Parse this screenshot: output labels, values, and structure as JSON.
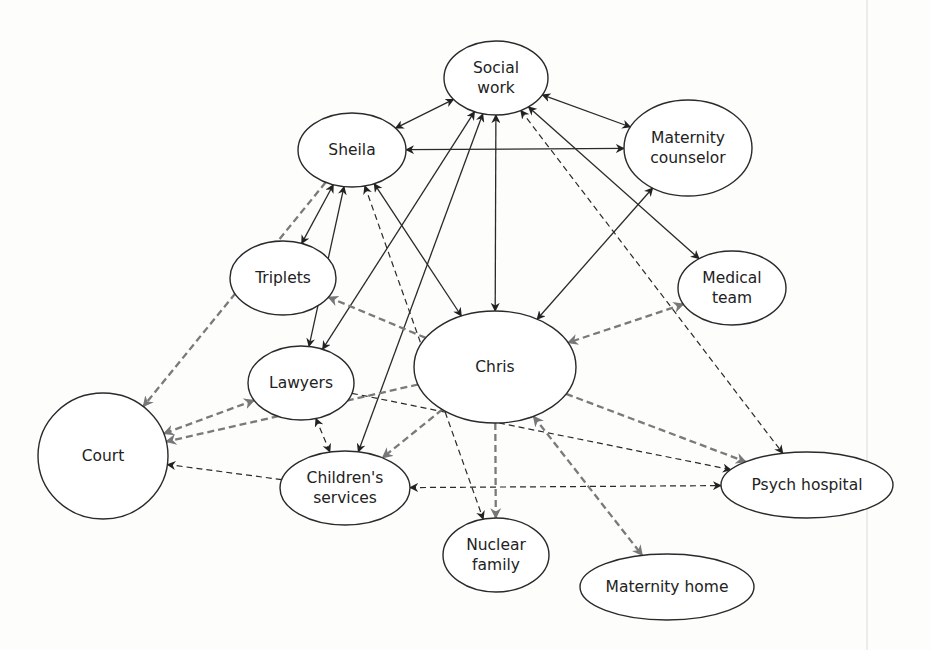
{
  "diagram": {
    "title": "",
    "colors": {
      "node_stroke": "#2a2a2a",
      "solid_edge": "#2a2a2a",
      "dashed_dark_edge": "#2a2a2a",
      "dashed_gray_edge": "#7a7a7a",
      "background": "#fdfdfc"
    },
    "nodes": [
      {
        "id": "social_work",
        "lines": [
          "Social",
          "work"
        ],
        "cx": 496,
        "cy": 78,
        "rx": 52,
        "ry": 37
      },
      {
        "id": "maternity_counselor",
        "lines": [
          "Maternity",
          "counselor"
        ],
        "cx": 688,
        "cy": 148,
        "rx": 64,
        "ry": 48
      },
      {
        "id": "sheila",
        "lines": [
          "Sheila"
        ],
        "cx": 352,
        "cy": 150,
        "rx": 54,
        "ry": 37
      },
      {
        "id": "triplets",
        "lines": [
          "Triplets"
        ],
        "cx": 283,
        "cy": 278,
        "rx": 53,
        "ry": 37
      },
      {
        "id": "medical_team",
        "lines": [
          "Medical",
          "team"
        ],
        "cx": 732,
        "cy": 288,
        "rx": 54,
        "ry": 37
      },
      {
        "id": "chris",
        "lines": [
          "Chris"
        ],
        "cx": 495,
        "cy": 367,
        "rx": 81,
        "ry": 56
      },
      {
        "id": "lawyers",
        "lines": [
          "Lawyers"
        ],
        "cx": 301,
        "cy": 383,
        "rx": 53,
        "ry": 37
      },
      {
        "id": "court",
        "lines": [
          "Court"
        ],
        "cx": 103,
        "cy": 456,
        "rx": 65,
        "ry": 63
      },
      {
        "id": "childrens_services",
        "lines": [
          "Children's",
          "services"
        ],
        "cx": 345,
        "cy": 488,
        "rx": 65,
        "ry": 37
      },
      {
        "id": "psych_hospital",
        "lines": [
          "Psych hospital"
        ],
        "cx": 807,
        "cy": 485,
        "rx": 86,
        "ry": 33
      },
      {
        "id": "nuclear_family",
        "lines": [
          "Nuclear",
          "family"
        ],
        "cx": 496,
        "cy": 555,
        "rx": 53,
        "ry": 37
      },
      {
        "id": "maternity_home",
        "lines": [
          "Maternity home"
        ],
        "cx": 667,
        "cy": 587,
        "rx": 87,
        "ry": 33
      }
    ],
    "edges": [
      {
        "from": "sheila",
        "to": "social_work",
        "style": "solid",
        "direction": "both"
      },
      {
        "from": "social_work",
        "to": "maternity_counselor",
        "style": "solid",
        "direction": "both"
      },
      {
        "from": "sheila",
        "to": "maternity_counselor",
        "style": "solid",
        "direction": "both"
      },
      {
        "from": "social_work",
        "to": "chris",
        "style": "solid",
        "direction": "both"
      },
      {
        "from": "social_work",
        "to": "medical_team",
        "style": "solid",
        "direction": "both"
      },
      {
        "from": "maternity_counselor",
        "to": "chris",
        "style": "solid",
        "direction": "both"
      },
      {
        "from": "sheila",
        "to": "triplets",
        "style": "solid",
        "direction": "both"
      },
      {
        "from": "sheila",
        "to": "chris",
        "style": "solid",
        "direction": "both"
      },
      {
        "from": "sheila",
        "to": "lawyers",
        "style": "solid",
        "direction": "both"
      },
      {
        "from": "social_work",
        "to": "lawyers",
        "style": "solid",
        "direction": "both"
      },
      {
        "from": "social_work",
        "to": "childrens_services",
        "style": "solid",
        "direction": "both"
      },
      {
        "from": "sheila",
        "to": "nuclear_family",
        "style": "dashed-dark",
        "direction": "both"
      },
      {
        "from": "social_work",
        "to": "psych_hospital",
        "style": "dashed-dark",
        "direction": "both"
      },
      {
        "from": "sheila",
        "to": "court",
        "style": "dashed-gray",
        "direction": "to"
      },
      {
        "from": "chris",
        "to": "triplets",
        "style": "dashed-gray",
        "direction": "to"
      },
      {
        "from": "medical_team",
        "to": "chris",
        "style": "dashed-gray",
        "direction": "both"
      },
      {
        "from": "lawyers",
        "to": "court",
        "style": "dashed-gray",
        "direction": "both"
      },
      {
        "from": "lawyers",
        "to": "childrens_services",
        "style": "dashed-dark",
        "direction": "both"
      },
      {
        "from": "chris",
        "to": "court",
        "style": "dashed-gray",
        "direction": "to"
      },
      {
        "from": "childrens_services",
        "to": "court",
        "style": "dashed-dark",
        "direction": "to"
      },
      {
        "from": "lawyers",
        "to": "psych_hospital",
        "style": "dashed-dark",
        "direction": "to"
      },
      {
        "from": "chris",
        "to": "psych_hospital",
        "style": "dashed-gray",
        "direction": "to"
      },
      {
        "from": "chris",
        "to": "childrens_services",
        "style": "dashed-gray",
        "direction": "to"
      },
      {
        "from": "chris",
        "to": "nuclear_family",
        "style": "dashed-gray",
        "direction": "to"
      },
      {
        "from": "childrens_services",
        "to": "psych_hospital",
        "style": "dashed-dark",
        "direction": "both"
      },
      {
        "from": "chris",
        "to": "maternity_home",
        "style": "dashed-gray",
        "direction": "both"
      }
    ]
  }
}
